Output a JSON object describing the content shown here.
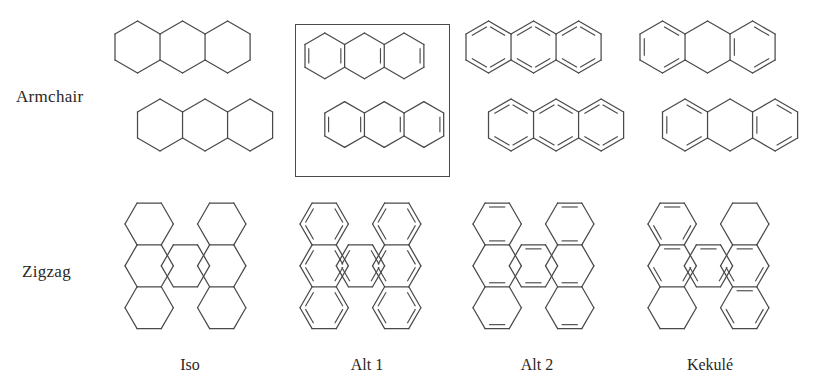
{
  "figure": {
    "background_color": "#ffffff",
    "line_color": "#4a4a4a",
    "text_color": "#2b2723"
  },
  "row_labels": [
    {
      "key": "armchair",
      "label": "Armchair"
    },
    {
      "key": "zigzag",
      "label": "Zigzag"
    }
  ],
  "column_labels": [
    {
      "key": "iso",
      "label": "Iso"
    },
    {
      "key": "alt1",
      "label": "Alt 1"
    },
    {
      "key": "alt2",
      "label": "Alt 2"
    },
    {
      "key": "kekule",
      "label": "Kekulé"
    }
  ],
  "highlight": {
    "cell": "armchair-alt1",
    "shape": "rectangle",
    "stroke_color": "#4a4a4a"
  },
  "chart_data": {
    "type": "diagram",
    "rows": [
      "Armchair",
      "Zigzag"
    ],
    "columns": [
      "Iso",
      "Alt 1",
      "Alt 2",
      "Kekulé"
    ],
    "cells": [
      {
        "row": "Armchair",
        "column": "Iso",
        "hexagon_count": 6,
        "lattice": "two staggered rows of three pointy-top hexagons",
        "double_bonds": "none"
      },
      {
        "row": "Armchair",
        "column": "Alt 1",
        "hexagon_count": 6,
        "lattice": "two staggered rows of three pointy-top hexagons",
        "double_bonds": "all vertical edges doubled",
        "highlighted": true
      },
      {
        "row": "Armchair",
        "column": "Alt 2",
        "hexagon_count": 6,
        "lattice": "two staggered rows of three pointy-top hexagons",
        "double_bonds": "slanted edges doubled"
      },
      {
        "row": "Armchair",
        "column": "Kekulé",
        "hexagon_count": 6,
        "lattice": "two staggered rows of three pointy-top hexagons",
        "double_bonds": "alternating Kekulé pattern, aromatic sextets"
      },
      {
        "row": "Zigzag",
        "column": "Iso",
        "hexagon_count": 7,
        "lattice": "flat-top hexagons, 3 left column + 1 centre + 3 right column",
        "double_bonds": "none"
      },
      {
        "row": "Zigzag",
        "column": "Alt 1",
        "hexagon_count": 7,
        "lattice": "flat-top hexagons, 3 left column + 1 centre + 3 right column",
        "double_bonds": "all slanted edges doubled"
      },
      {
        "row": "Zigzag",
        "column": "Alt 2",
        "hexagon_count": 7,
        "lattice": "flat-top hexagons, 3 left column + 1 centre + 3 right column",
        "double_bonds": "all horizontal edges doubled"
      },
      {
        "row": "Zigzag",
        "column": "Kekulé",
        "hexagon_count": 7,
        "lattice": "flat-top hexagons, 3 left column + 1 centre + 3 right column",
        "double_bonds": "alternating Kekulé pattern, aromatic sextets"
      }
    ]
  }
}
